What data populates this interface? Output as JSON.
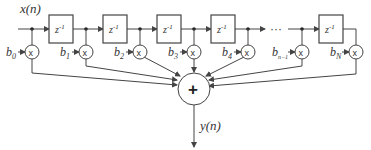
{
  "diagram": {
    "input_label": "x(n)",
    "output_label": "y(n)",
    "delay_label": "z",
    "delay_exp": "-1",
    "ellipsis": "···",
    "multiply_symbol": "x",
    "sum_symbol": "+",
    "coefficients": [
      {
        "base": "b",
        "sub": "0"
      },
      {
        "base": "b",
        "sub": "1"
      },
      {
        "base": "b",
        "sub": "2"
      },
      {
        "base": "b",
        "sub": "3"
      },
      {
        "base": "b",
        "sub": "4"
      },
      {
        "base": "b",
        "sub": "n−1"
      },
      {
        "base": "b",
        "sub": "N"
      }
    ],
    "colors": {
      "stroke": "#444444",
      "text": "#333333",
      "background": "#ffffff"
    }
  }
}
